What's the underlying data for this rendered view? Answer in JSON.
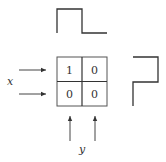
{
  "diagram": {
    "colors": {
      "stroke": "#333333",
      "background": "#ffffff"
    },
    "grid": {
      "rows": [
        [
          "1",
          "0"
        ],
        [
          "0",
          "0"
        ]
      ]
    },
    "labels": {
      "x": "x",
      "y": "y"
    },
    "waveforms": {
      "top": {
        "description": "column profile: high then low"
      },
      "right": {
        "description": "row profile: high then low"
      }
    },
    "arrows": {
      "x_inputs": 2,
      "y_inputs": 2
    }
  }
}
